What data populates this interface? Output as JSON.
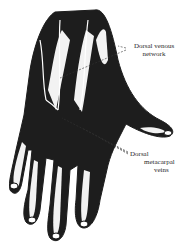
{
  "figure": {
    "ink_color": "#111111",
    "background_color": "#ffffff"
  },
  "labels": {
    "dorsal_venous_network": {
      "line1": "Dorsal venous",
      "line2": "network"
    },
    "dorsal_metacarpal_veins": {
      "line1": "Dorsal",
      "line2": "metacarpal",
      "line3": "veins"
    }
  }
}
